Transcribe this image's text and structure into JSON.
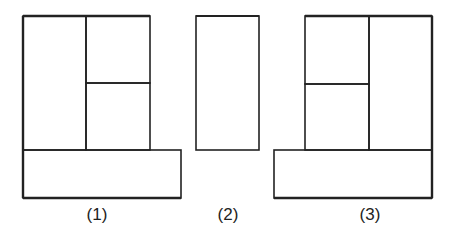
{
  "diagram": {
    "stroke_color": "#222222",
    "background": "#ffffff",
    "figures": [
      {
        "id": "figure-1",
        "label": "(1)",
        "label_x": 97,
        "shapes": [
          {
            "name": "upper-left-rect",
            "x": 23,
            "y": 16,
            "w": 63,
            "h": 134
          },
          {
            "name": "upper-right-top-rect",
            "x": 86,
            "y": 16,
            "w": 64,
            "h": 67
          },
          {
            "name": "upper-right-bottom-rect",
            "x": 86,
            "y": 83,
            "w": 64,
            "h": 67
          },
          {
            "name": "bottom-wide-rect",
            "x": 23,
            "y": 150,
            "w": 158,
            "h": 48
          }
        ]
      },
      {
        "id": "figure-2",
        "label": "(2)",
        "label_x": 228,
        "shapes": [
          {
            "name": "tall-rect",
            "x": 196,
            "y": 16,
            "w": 63,
            "h": 134
          }
        ]
      },
      {
        "id": "figure-3",
        "label": "(3)",
        "label_x": 370,
        "shapes": [
          {
            "name": "upper-left-top-rect",
            "x": 305,
            "y": 16,
            "w": 64,
            "h": 68
          },
          {
            "name": "upper-left-bottom-rect",
            "x": 305,
            "y": 84,
            "w": 64,
            "h": 66
          },
          {
            "name": "upper-right-rect",
            "x": 369,
            "y": 16,
            "w": 63,
            "h": 134
          },
          {
            "name": "bottom-wide-rect",
            "x": 274,
            "y": 150,
            "w": 158,
            "h": 48
          }
        ]
      }
    ]
  }
}
